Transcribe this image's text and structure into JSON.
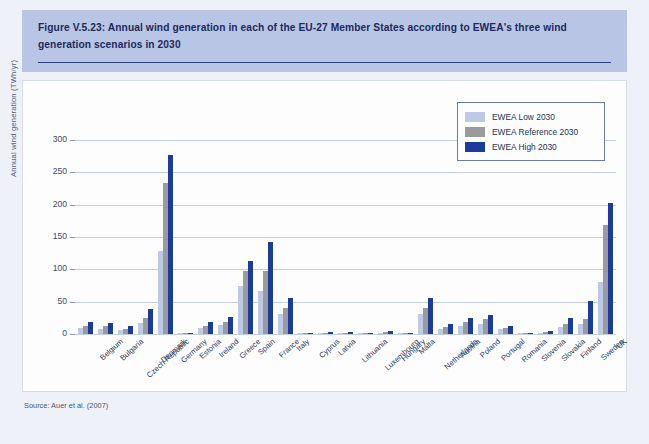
{
  "figure": {
    "title": "Figure V.5.23: Annual wind generation in each of the EU-27 Member States according to EWEA's three wind generation scenarios in 2030",
    "source": "Source: Auer et al. (2007)"
  },
  "legend": {
    "position": "top-right",
    "items": [
      {
        "label": "EWEA Low 2030",
        "color": "#bdc9e6"
      },
      {
        "label": "EWEA Reference 2030",
        "color": "#9b9b9b"
      },
      {
        "label": "EWEA High 2030",
        "color": "#1c3c9c"
      }
    ]
  },
  "chart_data": {
    "type": "bar",
    "title": "Annual wind generation in each of the EU-27 Member States according to EWEA's three wind generation scenarios in 2030",
    "xlabel": "",
    "ylabel": "Annual wind generation (TWh/yr)",
    "ylim": [
      0,
      300
    ],
    "yticks": [
      0,
      50,
      100,
      150,
      200,
      250,
      300
    ],
    "grid": true,
    "categories": [
      "Belgium",
      "Bulgaria",
      "Czech Republic",
      "Denmark",
      "Germany",
      "Estonia",
      "Ireland",
      "Greece",
      "Spain",
      "France",
      "Italy",
      "Cyprus",
      "Latvia",
      "Lithuania",
      "Luxembourg",
      "Hungary",
      "Malta",
      "Netherlands",
      "Austria",
      "Poland",
      "Portugal",
      "Romania",
      "Slovenia",
      "Slovakia",
      "Finland",
      "Sweden",
      "UK"
    ],
    "series": [
      {
        "name": "EWEA Low 2030",
        "color": "#bdc9e6",
        "values": [
          9,
          8,
          6,
          17,
          129,
          1,
          9,
          14,
          74,
          66,
          31,
          1,
          1,
          1,
          0.5,
          2,
          0.5,
          31,
          8,
          13,
          16,
          7,
          1,
          2,
          11,
          15,
          80
        ]
      },
      {
        "name": "EWEA Reference 2030",
        "color": "#9b9b9b",
        "values": [
          13,
          12,
          8,
          24,
          234,
          1,
          13,
          19,
          98,
          97,
          40,
          1,
          2,
          2,
          0.5,
          3,
          0.5,
          41,
          11,
          18,
          23,
          9,
          1,
          3,
          16,
          23,
          168
        ]
      },
      {
        "name": "EWEA High 2030",
        "color": "#1c3c9c",
        "values": [
          19,
          17,
          12,
          39,
          277,
          2,
          19,
          26,
          113,
          142,
          55,
          2,
          3,
          3,
          1,
          5,
          1,
          55,
          16,
          25,
          29,
          13,
          2,
          4,
          24,
          51,
          202
        ]
      }
    ]
  }
}
